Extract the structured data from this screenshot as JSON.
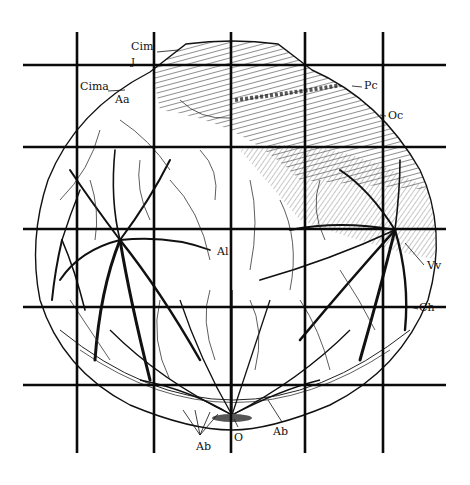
{
  "figure": {
    "colors": {
      "ink": "#111111",
      "background": "#ffffff",
      "grid": "#0a0a0a"
    },
    "grid": {
      "vertical_x": [
        77,
        154,
        231,
        305,
        383
      ],
      "horizontal_y": [
        65,
        147,
        229,
        307,
        385
      ],
      "v_span": [
        32,
        453
      ],
      "h_span": [
        23,
        446
      ]
    },
    "labels": [
      {
        "id": "cim",
        "text": "Cim",
        "x": 131,
        "y": 47
      },
      {
        "id": "j",
        "text": "J",
        "x": 131,
        "y": 62
      },
      {
        "id": "cima",
        "text": "Cima",
        "x": 80,
        "y": 86
      },
      {
        "id": "aa",
        "text": "Aa",
        "x": 115,
        "y": 98
      },
      {
        "id": "pc",
        "text": "Pc",
        "x": 364,
        "y": 82
      },
      {
        "id": "oc",
        "text": "Oc",
        "x": 388,
        "y": 111
      },
      {
        "id": "al",
        "text": "Al",
        "x": 219,
        "y": 246
      },
      {
        "id": "vv",
        "text": "Vv",
        "x": 427,
        "y": 261
      },
      {
        "id": "ch",
        "text": "Ch",
        "x": 419,
        "y": 305
      },
      {
        "id": "ab-left",
        "text": "Ab",
        "x": 198,
        "y": 444
      },
      {
        "id": "o",
        "text": "O",
        "x": 234,
        "y": 435
      },
      {
        "id": "ab-right",
        "text": "Ab",
        "x": 273,
        "y": 429
      }
    ]
  }
}
